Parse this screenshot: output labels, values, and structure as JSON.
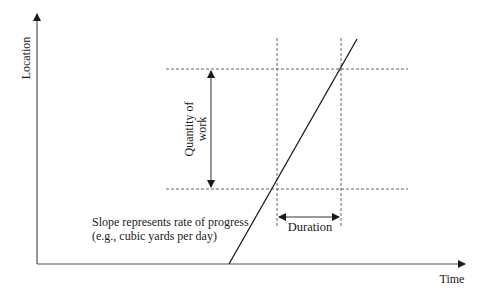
{
  "diagram": {
    "type": "linear-scheduling-diagram",
    "axes": {
      "y_label": "Location",
      "x_label": "Time"
    },
    "annotations": {
      "quantity_line1": "Quantity of",
      "quantity_line2": "work",
      "slope_line1": "Slope represents rate of progress",
      "slope_line2": "(e.g., cubic yards per day)",
      "duration": "Duration"
    },
    "colors": {
      "line": "#1a1a1a",
      "axis": "#555555",
      "dashed": "#666666",
      "background": "#ffffff"
    }
  }
}
